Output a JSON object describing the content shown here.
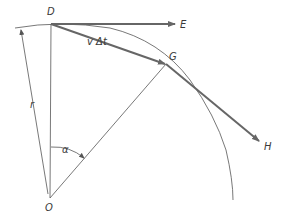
{
  "figure": {
    "type": "geometry-diagram",
    "points": {
      "D": {
        "label": "D",
        "x": 51,
        "y": 24
      },
      "E": {
        "label": "E",
        "x": 175,
        "y": 24
      },
      "G": {
        "label": "G",
        "x": 166,
        "y": 64
      },
      "H": {
        "label": "H",
        "x": 259,
        "y": 141
      },
      "O": {
        "label": "O",
        "x": 50,
        "y": 198
      }
    },
    "labels": {
      "D": "D",
      "E": "E",
      "G": "G",
      "H": "H",
      "O": "O",
      "r": "r",
      "alpha": "α",
      "v_delta_t": "v Δt"
    },
    "colors": {
      "thick_vector": "#666666",
      "thin_line": "#555555",
      "text": "#3a3a3a",
      "background": "#ffffff"
    }
  }
}
